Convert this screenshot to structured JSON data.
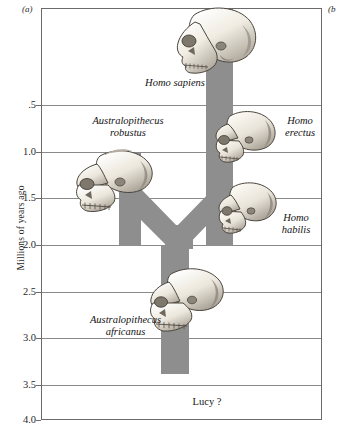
{
  "figure": {
    "panel_a_tag": "(a)",
    "panel_b_tag": "(b"
  },
  "axis": {
    "y_title": "Millions of years ago",
    "y_ticks": [
      ".5",
      "1.0",
      "1.5",
      "2.0",
      "2.5",
      "3.0",
      "3.5",
      "4.0"
    ]
  },
  "labels": {
    "homo_sapiens": "Homo sapiens",
    "australopithecus_robustus": "Australopithecus\nrobustus",
    "homo_erectus": "Homo\nerectus",
    "homo_habilis": "Homo\nhabilis",
    "australopithecus_africanus": "Australopithecus\nafricanus",
    "lucy": "Lucy ?"
  },
  "colors": {
    "lineage_gray": "#8e8e8e",
    "gridline": "#8a8a8a",
    "frame": "#6b6b6b",
    "text": "#141414",
    "skull_light": "#f4f1ea",
    "skull_shadow": "#9a948a",
    "background": "#ffffff"
  },
  "chart_data": {
    "type": "diagram",
    "title": "",
    "ylabel": "Millions of years ago",
    "ylim": [
      0,
      4.0
    ],
    "y_ticks": [
      0.5,
      1.0,
      1.5,
      2.0,
      2.5,
      3.0,
      3.5,
      4.0
    ],
    "y_tick_labels": [
      ".5",
      "1.0",
      "1.5",
      "2.0",
      "2.5",
      "3.0",
      "3.5",
      "4.0"
    ],
    "y_axis_inverted": true,
    "grid": true,
    "legend": "none",
    "taxa": [
      {
        "name": "Homo sapiens",
        "lineage": "homo",
        "range_mya": [
          0.0,
          2.0
        ],
        "skull": true,
        "skull_position_mya": 0.25
      },
      {
        "name": "Homo erectus",
        "lineage": "homo",
        "range_mya": [
          0.0,
          2.0
        ],
        "skull": true,
        "skull_position_mya": 1.05
      },
      {
        "name": "Homo habilis",
        "lineage": "homo",
        "range_mya": [
          0.0,
          2.0
        ],
        "skull": true,
        "skull_position_mya": 1.65
      },
      {
        "name": "Australopithecus robustus",
        "lineage": "robustus",
        "range_mya": [
          1.0,
          2.4
        ],
        "skull": true,
        "skull_position_mya": 1.35
      },
      {
        "name": "Australopithecus africanus",
        "lineage": "ancestral",
        "range_mya": [
          2.2,
          3.4
        ],
        "skull": true,
        "skull_position_mya": 2.55
      },
      {
        "name": "Lucy ?",
        "lineage": "ancestral",
        "range_mya": [
          3.4,
          3.4
        ],
        "skull": false,
        "annotation_mya": 3.6
      }
    ],
    "branch_point_mya": 2.2,
    "stem_base_mya": 3.4
  }
}
